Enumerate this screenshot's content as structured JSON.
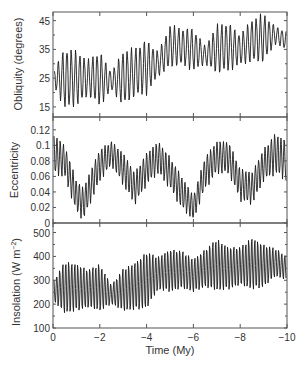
{
  "chart_data": [
    {
      "type": "line",
      "title": "",
      "xlabel": "Time (My)",
      "ylabel": "Obliquity (degrees)",
      "xlim": [
        0,
        -10
      ],
      "ylim": [
        11.5,
        48
      ],
      "yticks": [
        15,
        25,
        35,
        45
      ],
      "ytick_labels": [
        "15",
        "25",
        "35",
        "45"
      ],
      "grid": false,
      "series": [
        {
          "name": "Obliquity",
          "description": "Oscillating signal; envelope given as center and half-amplitude",
          "x": [
            0,
            -0.5,
            -1,
            -1.5,
            -2,
            -2.5,
            -3,
            -3.5,
            -4,
            -4.5,
            -5,
            -5.5,
            -6,
            -6.5,
            -7,
            -7.5,
            -8,
            -8.5,
            -9,
            -9.5,
            -10
          ],
          "center": [
            25,
            25,
            25,
            25,
            25,
            24,
            25,
            27,
            29,
            30,
            36,
            36,
            35,
            33,
            35,
            36,
            35,
            38,
            39,
            40,
            38
          ],
          "amplitude": [
            2,
            10,
            9,
            6,
            9,
            3,
            9,
            8,
            9,
            4,
            7,
            6,
            7,
            3,
            8,
            8,
            5,
            7,
            8,
            3,
            3
          ]
        }
      ]
    },
    {
      "type": "line",
      "title": "",
      "xlabel": "Time (My)",
      "ylabel": "Eccentricity",
      "xlim": [
        0,
        -10
      ],
      "ylim": [
        0,
        0.135
      ],
      "yticks": [
        0,
        0.02,
        0.04,
        0.06,
        0.08,
        0.1,
        0.12
      ],
      "ytick_labels": [
        "0",
        "0.02",
        "0.04",
        "0.06",
        "0.08",
        "0.1",
        "0.12"
      ],
      "grid": false,
      "series": [
        {
          "name": "Eccentricity",
          "x": [
            0,
            -0.5,
            -1,
            -1.3,
            -1.5,
            -2,
            -2.5,
            -3,
            -3.5,
            -4,
            -4.5,
            -5,
            -5.5,
            -6,
            -6.5,
            -7,
            -7.5,
            -8,
            -8.5,
            -9,
            -9.5,
            -10
          ],
          "center": [
            0.09,
            0.08,
            0.035,
            0.025,
            0.04,
            0.075,
            0.09,
            0.07,
            0.045,
            0.07,
            0.085,
            0.065,
            0.04,
            0.02,
            0.065,
            0.085,
            0.085,
            0.05,
            0.045,
            0.075,
            0.09,
            0.08
          ],
          "amplitude": [
            0.025,
            0.02,
            0.02,
            0.02,
            0.02,
            0.02,
            0.015,
            0.02,
            0.02,
            0.02,
            0.02,
            0.02,
            0.02,
            0.015,
            0.02,
            0.02,
            0.02,
            0.02,
            0.02,
            0.02,
            0.025,
            0.025
          ]
        }
      ]
    },
    {
      "type": "line",
      "title": "",
      "xlabel": "Time (My)",
      "ylabel": "Insolation (W m⁻²)",
      "xlim": [
        0,
        -10
      ],
      "ylim": [
        100,
        540
      ],
      "yticks": [
        100,
        200,
        300,
        400,
        500
      ],
      "ytick_labels": [
        "100",
        "200",
        "300",
        "400",
        "500"
      ],
      "xticks": [
        0,
        -2,
        -4,
        -6,
        -8,
        -10
      ],
      "xtick_labels": [
        "0",
        "−2",
        "−4",
        "−6",
        "−8",
        "−10"
      ],
      "grid": false,
      "series": [
        {
          "name": "Insolation",
          "x": [
            0,
            -0.5,
            -1,
            -1.5,
            -2,
            -2.5,
            -3,
            -3.5,
            -4,
            -4.5,
            -5,
            -5.5,
            -6,
            -6.5,
            -7,
            -7.5,
            -8,
            -8.5,
            -9,
            -9.5,
            -10
          ],
          "center": [
            255,
            270,
            270,
            265,
            270,
            240,
            260,
            275,
            300,
            330,
            340,
            345,
            320,
            350,
            365,
            350,
            360,
            370,
            360,
            375,
            350
          ],
          "amplitude": [
            40,
            110,
            100,
            80,
            100,
            40,
            90,
            100,
            120,
            70,
            90,
            80,
            70,
            80,
            110,
            90,
            80,
            110,
            90,
            60,
            50
          ]
        }
      ]
    }
  ],
  "axes": {
    "xlabel": "Time (My)",
    "xtick_labels": [
      "0",
      "−2",
      "−4",
      "−6",
      "−8",
      "−10"
    ],
    "panel1_ylabel": "Obliquity (degrees)",
    "panel2_ylabel": "Eccentricity",
    "panel3_ylabel_main": "Insolation (W m",
    "panel3_ylabel_sup": "−2",
    "panel3_ylabel_close": ")",
    "panel1_yticks": [
      "15",
      "25",
      "35",
      "45"
    ],
    "panel2_yticks": [
      "0",
      "0.02",
      "0.04",
      "0.06",
      "0.08",
      "0.1",
      "0.12"
    ],
    "panel3_yticks": [
      "100",
      "200",
      "300",
      "400",
      "500"
    ]
  },
  "colors": {
    "line": "#1a1a1a",
    "axis": "#555555",
    "text": "#333333"
  }
}
